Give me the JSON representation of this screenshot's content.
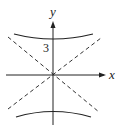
{
  "diagram": {
    "type": "hyperbola",
    "axes": {
      "x_label": "x",
      "y_label": "y"
    },
    "vertex_label": "3",
    "asymptotes": "dashed lines through origin",
    "branches": [
      "upper",
      "lower"
    ]
  }
}
